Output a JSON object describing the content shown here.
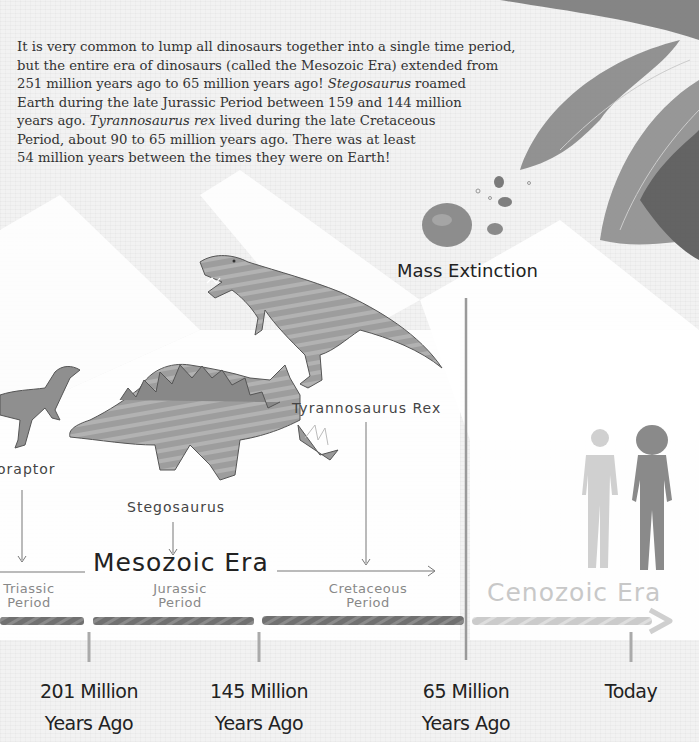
{
  "intro": {
    "line1": "It is very common to lump all dinosaurs together into a single time period,",
    "line2": "but the entire era of dinosaurs (called the Mesozoic Era) extended from",
    "line3_pre": "251 million years ago to 65 million years ago! ",
    "line3_italic": "Stegosaurus",
    "line3_post": " roamed",
    "line4": "Earth during the late Jurassic Period between 159 and 144 million",
    "line5_pre": "years ago. ",
    "line5_italic": "Tyrannosaurus rex",
    "line5_post": " lived during the late Cretaceous",
    "line6": "Period, about 90 to 65 million years ago. There was at least",
    "line7": "54 million years between the times they were on Earth!"
  },
  "event": {
    "mass_extinction": "Mass Extinction"
  },
  "dinosaurs": {
    "raptor": "oraptor",
    "stegosaurus": "Stegosaurus",
    "trex": "Tyrannosaurus Rex"
  },
  "eras": {
    "mesozoic": "Mesozoic Era",
    "cenozoic": "Cenozoic Era"
  },
  "periods": [
    {
      "line1": "Triassic",
      "line2": "Period"
    },
    {
      "line1": "Jurassic",
      "line2": "Period"
    },
    {
      "line1": "Cretaceous",
      "line2": "Period"
    }
  ],
  "ticks": [
    {
      "line1": "201 Million",
      "line2": "Years Ago"
    },
    {
      "line1": "145 Million",
      "line2": "Years Ago"
    },
    {
      "line1": "65 Million",
      "line2": "Years Ago"
    },
    {
      "line1": "Today",
      "line2": ""
    }
  ],
  "colors": {
    "bar_dark": "#6e6e6e",
    "bar_light": "#cfcfcf",
    "divider": "#9a9a9a",
    "text": "#222222"
  }
}
